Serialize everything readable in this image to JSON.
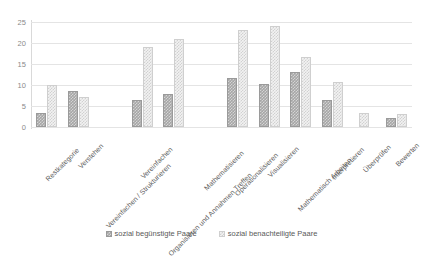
{
  "chart_data": {
    "type": "bar",
    "title": "",
    "subtitle": "",
    "xlabel": "",
    "ylabel": "",
    "ylim": [
      0,
      25
    ],
    "yticks": [
      0,
      5,
      10,
      15,
      20,
      25
    ],
    "grid": true,
    "legend_position": "bottom",
    "categories": [
      "Restkategorie",
      "Verstehen",
      "Vereinfachen / Strukturieren",
      "Vereinfachen",
      "Organisieren und Annahmen Treffen",
      "Mathematisieren",
      "Operationalisieren",
      "Visualisieren",
      "Mathematisch Arbeiten",
      "Interpretieren",
      "Überprüfen",
      "Bewerten"
    ],
    "series": [
      {
        "name": "sozial begünstigte Paare",
        "color": "#a6a6a6",
        "values": [
          3.3,
          8.6,
          null,
          6.5,
          7.9,
          null,
          11.6,
          10.2,
          13.0,
          6.4,
          null,
          2.2
        ]
      },
      {
        "name": "sozial benachteiligte Paare",
        "color": "#f2f2f2",
        "values": [
          10.1,
          7.1,
          null,
          19.0,
          20.9,
          null,
          23.2,
          24.0,
          16.7,
          10.6,
          3.3,
          3.2
        ]
      }
    ]
  }
}
